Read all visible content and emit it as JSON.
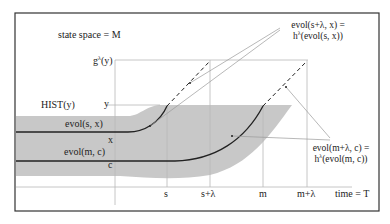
{
  "figure": {
    "type": "diagram",
    "state_space_label": "state space = M",
    "time_axis_label": "time = T",
    "y_axis_labels": {
      "g_lambda_y": "g",
      "g_sup": "λ",
      "g_arg": "(y)",
      "y": "y",
      "x": "x",
      "c": "c"
    },
    "hist_label": "HIST(y)",
    "curve_labels": {
      "evol_s_x": "evol(s, x)",
      "evol_m_c": "evol(m, c)"
    },
    "time_ticks": [
      "s",
      "s+λ",
      "m",
      "m+λ"
    ],
    "annotations": {
      "top_right_line1": "evol(s+λ, x) =",
      "top_right_line2_pre": "h",
      "top_right_line2_sup": "λ",
      "top_right_line2_post": "(evol(s, x))",
      "bottom_right_line1": "evol(m+λ, c) =",
      "bottom_right_line2_pre": "h",
      "bottom_right_line2_sup": "λ",
      "bottom_right_line2_post": "(evol(m, c))"
    },
    "colors": {
      "shade": "#c8c8c8",
      "grid": "#b8b8b8",
      "curve": "#222222",
      "border": "#333333"
    }
  }
}
